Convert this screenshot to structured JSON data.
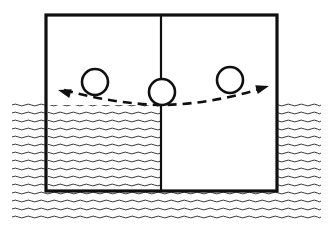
{
  "figure": {
    "title": "",
    "caption": "",
    "background_color": "#ffffff",
    "ink_color": "#101010",
    "water_color": "#3a3a3a",
    "width": 334,
    "height": 234
  },
  "scene": {
    "description": "Partially submerged two-compartment box floating at a water surface with a ball rocking along a dashed arc",
    "water": {
      "label": "water",
      "surface_y": 105,
      "bottom_y": 223,
      "left_x": 12,
      "right_x": 321,
      "wave_row_spacing": 8,
      "wave_wavelength": 13,
      "wave_amplitude": 1.8,
      "stroke_color": "#3a3a3a",
      "stroke_width": 1
    },
    "box": {
      "label": "floating-box",
      "left_x": 46,
      "right_x": 277,
      "top_y": 15,
      "bottom_y": 191,
      "stroke_color": "#101010",
      "stroke_width": 3.2,
      "fill": "#ffffff"
    },
    "divider": {
      "label": "center-partition",
      "x": 161,
      "top_y": 15,
      "bottom_y": 191,
      "stroke_color": "#101010",
      "stroke_width": 2.2
    },
    "compartments": [
      {
        "label": "left-compartment",
        "contents": "water",
        "flooded": true,
        "fill_top_y": 105,
        "fill_bottom_y": 190,
        "left_x": 48,
        "right_x": 160
      },
      {
        "label": "right-compartment",
        "contents": "air",
        "flooded": false,
        "left_x": 163,
        "right_x": 275,
        "fill": "#ffffff"
      }
    ],
    "balls": [
      {
        "label": "ball-left-position",
        "cx": 95,
        "cy": 82,
        "r": 13,
        "stroke_color": "#101010",
        "stroke_width": 2.6,
        "fill": "#ffffff"
      },
      {
        "label": "ball-center-position",
        "cx": 162,
        "cy": 92,
        "r": 13,
        "stroke_color": "#101010",
        "stroke_width": 2.6,
        "fill": "#ffffff"
      },
      {
        "label": "ball-right-position",
        "cx": 230,
        "cy": 80,
        "r": 13,
        "stroke_color": "#101010",
        "stroke_width": 2.6,
        "fill": "#ffffff"
      }
    ],
    "motion_arc": {
      "label": "rocking-motion-arc",
      "style": "dashed",
      "dash_pattern": "9 6",
      "stroke_color": "#101010",
      "stroke_width": 2.6,
      "path": "M 64 90 Q 115 104 162 105 Q 212 104 263 88",
      "start_point": [
        64,
        90
      ],
      "end_point": [
        263,
        88
      ],
      "lowest_point": [
        162,
        105
      ],
      "arrowheads": [
        {
          "label": "arrowhead-left",
          "tip": [
            58,
            90
          ],
          "angle_deg": 196,
          "length": 13,
          "half_width": 4.5
        },
        {
          "label": "arrowhead-right",
          "tip": [
            269,
            86
          ],
          "angle_deg": -16,
          "length": 13,
          "half_width": 4.5
        }
      ]
    }
  }
}
